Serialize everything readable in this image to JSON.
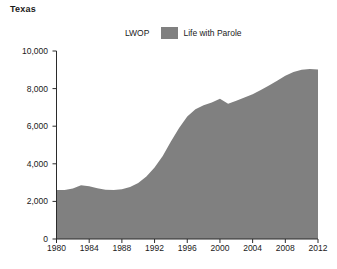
{
  "chart_data": {
    "type": "area",
    "title": "Texas",
    "xlabel": "",
    "ylabel": "",
    "xlim": [
      1980,
      2012
    ],
    "ylim": [
      0,
      10000
    ],
    "grid": false,
    "legend_position": "top-center",
    "series": [
      {
        "name": "LWOP",
        "color": "#ffffff",
        "values": [
          0,
          0,
          0,
          0,
          0,
          0,
          0,
          0,
          0,
          0,
          0,
          0,
          0,
          0,
          0,
          0,
          0,
          0,
          0,
          0,
          0,
          0,
          0,
          0,
          0,
          0,
          0,
          0,
          0,
          0,
          0,
          0,
          0
        ]
      },
      {
        "name": "Life with Parole",
        "color": "#808080",
        "values": [
          2600,
          2600,
          2680,
          2860,
          2800,
          2700,
          2620,
          2600,
          2640,
          2760,
          2980,
          3320,
          3800,
          4420,
          5180,
          5900,
          6520,
          6900,
          7120,
          7260,
          7460,
          7200,
          7360,
          7520,
          7700,
          7920,
          8160,
          8420,
          8680,
          8880,
          9000,
          9040,
          9020
        ]
      }
    ],
    "x": [
      1980,
      1981,
      1982,
      1983,
      1984,
      1985,
      1986,
      1987,
      1988,
      1989,
      1990,
      1991,
      1992,
      1993,
      1994,
      1995,
      1996,
      1997,
      1998,
      1999,
      2000,
      2001,
      2002,
      2003,
      2004,
      2005,
      2006,
      2007,
      2008,
      2009,
      2010,
      2011,
      2012
    ],
    "yticks": [
      0,
      2000,
      4000,
      6000,
      8000,
      10000
    ],
    "ytick_labels": [
      "0",
      "2,000",
      "4,000",
      "6,000",
      "8,000",
      "10,000"
    ],
    "xticks": [
      1980,
      1984,
      1988,
      1992,
      1996,
      2000,
      2004,
      2008,
      2012
    ],
    "xtick_labels": [
      "1980",
      "1984",
      "1988",
      "1992",
      "1996",
      "2000",
      "2004",
      "2008",
      "2012"
    ]
  },
  "legend": {
    "entries": [
      {
        "label": "LWOP",
        "color": "#ffffff"
      },
      {
        "label": "Life with Parole",
        "color": "#808080"
      }
    ]
  },
  "colors": {
    "axis": "#2b2b2b",
    "text": "#1a1a1a",
    "area_fill": "#808080",
    "background": "#ffffff"
  }
}
